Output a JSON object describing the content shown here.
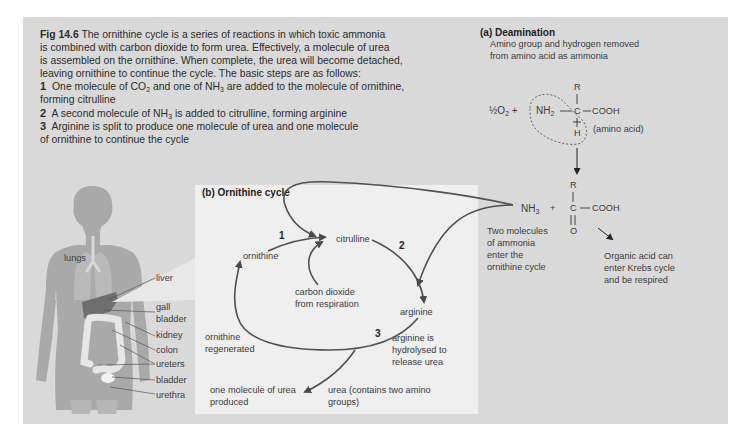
{
  "figure": {
    "label": "Fig 14.6",
    "caption_lines": [
      " The ornithine cycle is a series of reactions in which toxic ammonia",
      "is combined with carbon dioxide to form urea. Effectively, a molecule of urea",
      "is assembled on the ornithine. When complete, the urea will become detached,",
      "leaving ornithine to continue the cycle. The basic steps are as follows:"
    ],
    "steps": [
      {
        "num": "1",
        "text_a": "One molecule of CO",
        "sub_a": "2",
        "text_b": " and one of NH",
        "sub_b": "3",
        "text_c": " are added to the molecule of ornithine,",
        "cont": "forming citrulline"
      },
      {
        "num": "2",
        "text_a": "A second molecule of NH",
        "sub_a": "3",
        "text_b": " is added to citrulline, forming arginine"
      },
      {
        "num": "3",
        "text_a": "Arginine is split to produce one molecule of urea and one molecule",
        "cont": "of ornithine to continue the cycle"
      }
    ]
  },
  "body_diagram": {
    "labels": [
      "lungs",
      "liver",
      "gall",
      "bladder",
      "kidney",
      "colon",
      "ureters",
      "bladder",
      "urethra"
    ]
  },
  "deamination": {
    "title": "(a) Deamination",
    "desc_lines": [
      "Amino group and hydrogen removed",
      "from amino acid as ammonia"
    ],
    "oxygen": "½O",
    "oxygen_sub": "2",
    "plus": "+",
    "amino_group": "NH",
    "amino_sub": "2",
    "r_group": "R",
    "carbon": "C",
    "carboxyl": "COOH",
    "hydrogen": "H",
    "amino_acid_label": "(amino acid)",
    "product_ammonia": "NH",
    "product_ammonia_sub": "3",
    "product_plus": "+",
    "product_r": "R",
    "product_c": "C",
    "product_cooh": "COOH",
    "product_o": "O",
    "ammonia_note": [
      "Two molecules",
      "of ammonia",
      "enter the",
      "ornithine cycle"
    ],
    "organic_acid_note": [
      "Organic acid can",
      "enter Krebs cycle",
      "and be respired"
    ]
  },
  "ornithine_cycle": {
    "title": "(b) Ornithine cycle",
    "nodes": {
      "ornithine": "ornithine",
      "citrulline": "citrulline",
      "arginine": "arginine"
    },
    "step_numbers": [
      "1",
      "2",
      "3"
    ],
    "co2_note": [
      "carbon dioxide",
      "from respiration"
    ],
    "regenerated_note": [
      "ornithine",
      "regenerated"
    ],
    "hydrolysed_note": [
      "arginine is",
      "hydrolysed to",
      "release urea"
    ],
    "urea_produced_note": [
      "one molecule of urea",
      "produced"
    ],
    "urea_note": [
      "urea (contains two amino",
      "groups)"
    ]
  },
  "colors": {
    "outer_bg": "#d9d9d9",
    "panel_bg": "#efefef",
    "arrow": "#555555",
    "silhouette": "#a9a9a9",
    "liver": "#6e6e6e"
  }
}
